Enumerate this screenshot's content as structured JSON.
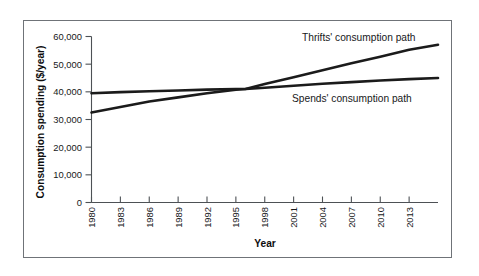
{
  "figure": {
    "frame_color": "#6f7378",
    "background": "#ffffff",
    "line_color": "#1b1b1b",
    "axis_color": "#4d5155"
  },
  "chart_data": {
    "type": "line",
    "title": "",
    "xlabel": "Year",
    "ylabel": "Consumption spending ($/year)",
    "xlim": [
      1980,
      2016
    ],
    "ylim": [
      0,
      60000
    ],
    "grid": false,
    "legend_position": "inline-annotation",
    "x_tick_labels": [
      "1980",
      "1983",
      "1986",
      "1989",
      "1992",
      "1995",
      "1998",
      "2001",
      "2004",
      "2007",
      "2010",
      "2013"
    ],
    "x_ticks": [
      1980,
      1983,
      1986,
      1989,
      1992,
      1995,
      1998,
      2001,
      2004,
      2007,
      2010,
      2013
    ],
    "y_tick_labels": [
      "0",
      "10,000",
      "20,000",
      "30,000",
      "40,000",
      "50,000",
      "60,000"
    ],
    "y_ticks": [
      0,
      10000,
      20000,
      30000,
      40000,
      50000,
      60000
    ],
    "x": [
      1980,
      1983,
      1986,
      1989,
      1992,
      1995,
      1996,
      1998,
      2001,
      2004,
      2007,
      2010,
      2013,
      2016
    ],
    "series": [
      {
        "name": "Thrifts' consumption path",
        "label": "Thrifts' consumption path",
        "color": "#1b1b1b",
        "values": [
          32500,
          34500,
          36500,
          38000,
          39500,
          40800,
          41000,
          42800,
          45300,
          47800,
          50300,
          52700,
          55200,
          57000
        ]
      },
      {
        "name": "Spends' consumption path",
        "label": "Spends' consumption path",
        "color": "#1b1b1b",
        "values": [
          39500,
          39900,
          40200,
          40500,
          40800,
          41000,
          41000,
          41500,
          42200,
          42900,
          43500,
          44100,
          44600,
          45000
        ]
      }
    ],
    "annotations": [
      {
        "text": "Thrifts' consumption path",
        "x_px": 302,
        "y_px": 41
      },
      {
        "text": "Spends' consumption path",
        "x_px": 292,
        "y_px": 102
      }
    ]
  }
}
